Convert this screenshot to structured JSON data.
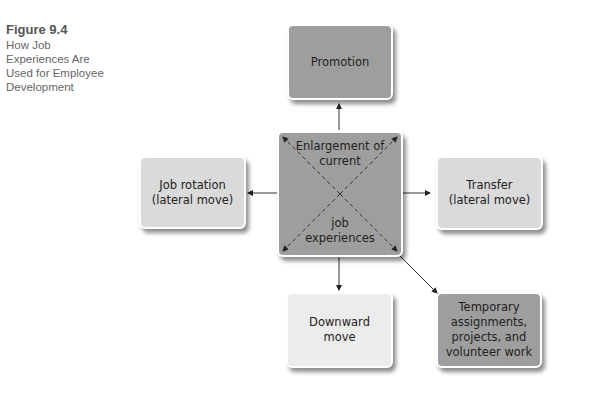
{
  "caption": {
    "figure_number": "Figure 9.4",
    "title_lines": [
      "How Job",
      "Experiences Are",
      "Used for Employee",
      "Development"
    ]
  },
  "center": {
    "label_top": "Enlargement of current",
    "label_top_line1": "Enlargement of",
    "label_top_line2": "current",
    "label_bottom_line1": "job",
    "label_bottom_line2": "experiences",
    "color": "#9e9e9e"
  },
  "nodes": {
    "promotion": {
      "label": "Promotion",
      "color": "#9e9e9e"
    },
    "job_rotation": {
      "line1": "Job rotation",
      "line2": "(lateral move)",
      "color": "#d9d9d9"
    },
    "transfer": {
      "line1": "Transfer",
      "line2": "(lateral move)",
      "color": "#d9d9d9"
    },
    "downward": {
      "line1": "Downward",
      "line2": "move",
      "color": "#ececec"
    },
    "temporary": {
      "line1": "Temporary",
      "line2": "assignments,",
      "line3": "projects, and",
      "line4": "volunteer work",
      "color": "#9e9e9e"
    }
  }
}
